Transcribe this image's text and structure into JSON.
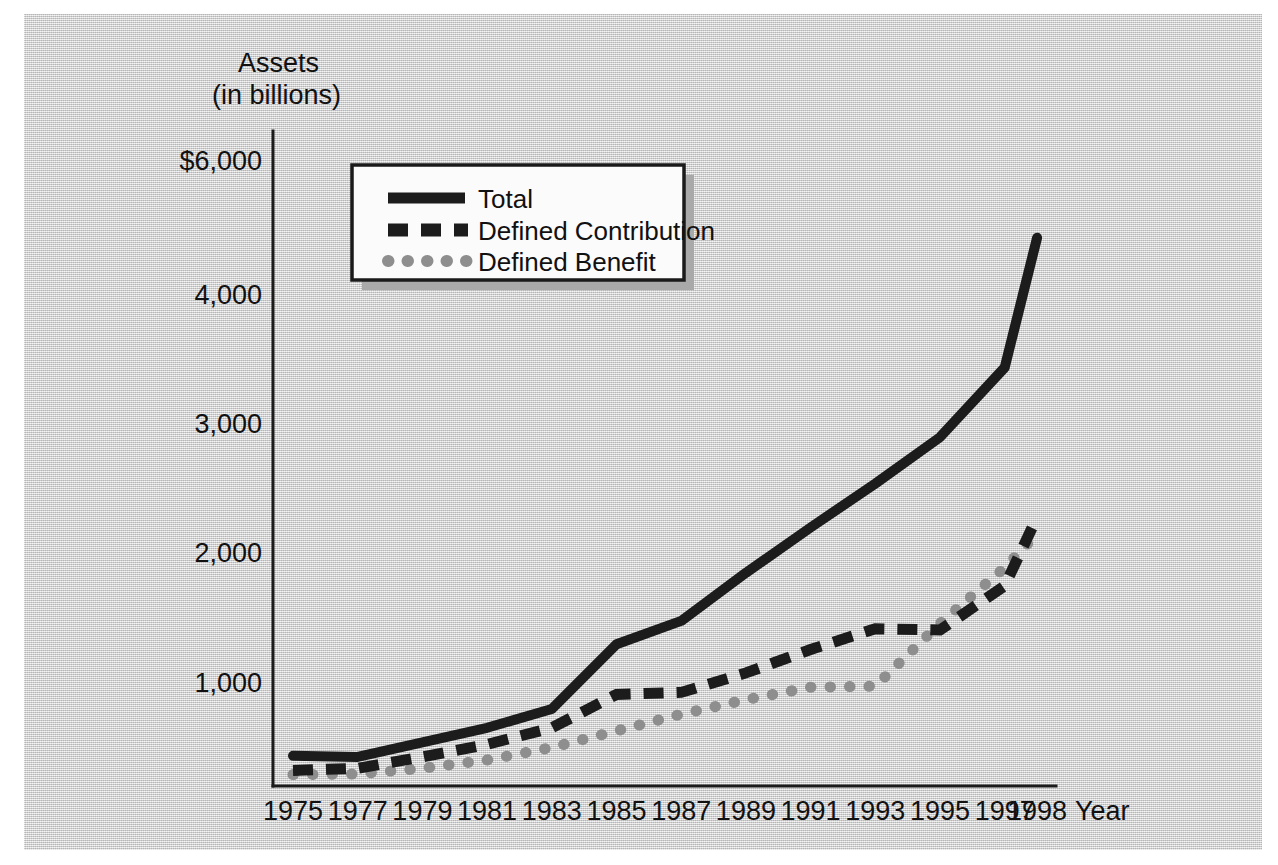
{
  "chart_data": {
    "type": "line",
    "title": "",
    "ylabel_line1": "Assets",
    "ylabel_line2": "(in billions)",
    "xlabel": "Year",
    "categories": [
      "1975",
      "1977",
      "1979",
      "1981",
      "1983",
      "1985",
      "1987",
      "1989",
      "1991",
      "1993",
      "1995",
      "1997",
      "1998"
    ],
    "x": [
      1975,
      1977,
      1979,
      1981,
      1983,
      1985,
      1987,
      1989,
      1991,
      1993,
      1995,
      1997,
      1998
    ],
    "ytick_labels": [
      "$6,000",
      "4,000",
      "3,000",
      "2,000",
      "1,000"
    ],
    "ytick_values": [
      6000,
      4000,
      3000,
      2000,
      1000
    ],
    "ylim": [
      0,
      6000
    ],
    "grid": false,
    "legend_position": "upper-left-inside",
    "series": [
      {
        "name": "Total",
        "style": "solid",
        "color": "#1c1c1c",
        "values": [
          290,
          280,
          420,
          560,
          740,
          1290,
          1470,
          1840,
          2190,
          2530,
          2890,
          3430,
          4840
        ]
      },
      {
        "name": "Defined Contribution",
        "style": "dashed",
        "color": "#1c1c1c",
        "values": [
          150,
          170,
          280,
          400,
          560,
          880,
          900,
          1070,
          1250,
          1410,
          1400,
          1740,
          2270
        ]
      },
      {
        "name": "Defined Benefit",
        "style": "dotted",
        "color": "#8e8e8e",
        "values": [
          110,
          115,
          170,
          250,
          370,
          530,
          690,
          830,
          950,
          960,
          1450,
          1880,
          2140
        ]
      }
    ]
  },
  "legend": {
    "items": [
      {
        "label": "Total"
      },
      {
        "label": "Defined Contribution"
      },
      {
        "label": "Defined Benefit"
      }
    ]
  },
  "axes": {
    "y_title_line1": "Assets",
    "y_title_line2": "(in billions)",
    "x_title": "Year"
  }
}
